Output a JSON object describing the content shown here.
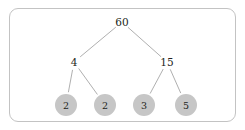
{
  "figure": {
    "kind": "factor-tree-diagram",
    "frame": {
      "border_color": "#c3c3c3",
      "background_color": "#ffffff",
      "corner_radius": 9
    },
    "colors": {
      "edge": "#9a9a9a",
      "leaf_fill": "#c6c6c6",
      "text": "#231f20"
    }
  },
  "chart_data": {
    "type": "diagram",
    "title": "",
    "xlabel": "",
    "ylabel": "",
    "nodes": [
      {
        "id": "root",
        "label": "60",
        "level": 0,
        "shape": "plain",
        "x": 122,
        "y": 22
      },
      {
        "id": "l1a",
        "label": "4",
        "level": 1,
        "shape": "plain",
        "x": 74,
        "y": 62
      },
      {
        "id": "l1b",
        "label": "15",
        "level": 1,
        "shape": "plain",
        "x": 167,
        "y": 62
      },
      {
        "id": "l2a",
        "label": "2",
        "level": 2,
        "shape": "circle",
        "x": 66,
        "y": 105,
        "r": 11
      },
      {
        "id": "l2b",
        "label": "2",
        "level": 2,
        "shape": "circle",
        "x": 105,
        "y": 105,
        "r": 11
      },
      {
        "id": "l2c",
        "label": "3",
        "level": 2,
        "shape": "circle",
        "x": 144,
        "y": 105,
        "r": 11
      },
      {
        "id": "l2d",
        "label": "5",
        "level": 2,
        "shape": "circle",
        "x": 186,
        "y": 105,
        "r": 11
      }
    ],
    "edges": [
      {
        "from": "root",
        "to": "l1a"
      },
      {
        "from": "root",
        "to": "l1b"
      },
      {
        "from": "l1a",
        "to": "l2a"
      },
      {
        "from": "l1a",
        "to": "l2b"
      },
      {
        "from": "l1b",
        "to": "l2c"
      },
      {
        "from": "l1b",
        "to": "l2d"
      }
    ]
  }
}
